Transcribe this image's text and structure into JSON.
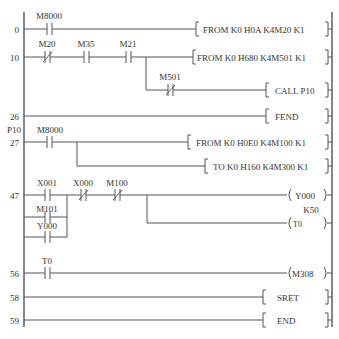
{
  "diagram": {
    "type": "PLC ladder diagram",
    "line_color": "#555555",
    "text_color": "#333333",
    "rungs": [
      {
        "step": "0",
        "contacts": [
          {
            "label": "M8000",
            "type": "NO"
          }
        ],
        "instruction": "[ FROM  K0  H0A  K4M20  K1 ]"
      },
      {
        "step": "10",
        "contacts": [
          {
            "label": "M20",
            "type": "NC"
          },
          {
            "label": "M35",
            "type": "NO"
          },
          {
            "label": "M21",
            "type": "NO"
          }
        ],
        "instruction": "[FROM  K0  H680  K4M501  K1]",
        "branch": {
          "contacts": [
            {
              "label": "M501",
              "type": "NC"
            }
          ],
          "instruction": "[ CALL  P10 ]"
        }
      },
      {
        "step": "26",
        "contacts": [],
        "instruction": "[ FEND        ]"
      },
      {
        "pointer": "P10",
        "step": "27",
        "contacts": [
          {
            "label": "M8000",
            "type": "NO"
          }
        ],
        "instruction": "[ FROM  K0  H0E0  K4M100  K1]",
        "branch": {
          "contacts": [],
          "instruction": "[ TO  K0  H160  K4M300  K1]"
        }
      },
      {
        "step": "47",
        "contacts": [
          {
            "label": "X001",
            "type": "NO"
          },
          {
            "label": "X000",
            "type": "NC"
          },
          {
            "label": "M100",
            "type": "NC"
          }
        ],
        "parallel_contacts": [
          {
            "label": "M101",
            "type": "NO"
          },
          {
            "label": "Y000",
            "type": "NO"
          }
        ],
        "coil": "( Y000 )",
        "branch": {
          "coil": "(T0      )",
          "setting": "K50"
        }
      },
      {
        "step": "56",
        "contacts": [
          {
            "label": "T0",
            "type": "NO"
          }
        ],
        "coil": "(M308 )"
      },
      {
        "step": "58",
        "contacts": [],
        "instruction": "[ SRET       ]"
      },
      {
        "step": "59",
        "contacts": [],
        "instruction": "[ END        ]"
      }
    ]
  },
  "labels": {
    "r0_step": "0",
    "r0_c1": "M8000",
    "r0_instr": "FROM  K0  H0A  K4M20  K1",
    "r1_step": "10",
    "r1_c1": "M20",
    "r1_c2": "M35",
    "r1_c3": "M21",
    "r1_instr": "FROM  K0  H680  K4M501  K1",
    "r1_b_c1": "M501",
    "r1_b_instr": "CALL  P10",
    "r2_step": "26",
    "r2_instr": "FEND",
    "r3_pointer": "P10",
    "r3_step": "27",
    "r3_c1": "M8000",
    "r3_instr": "FROM  K0  H0E0  K4M100  K1",
    "r3_b_instr": "TO  K0  H160  K4M300  K1",
    "r4_step": "47",
    "r4_c1": "X001",
    "r4_c2": "X000",
    "r4_c3": "M100",
    "r4_p1": "M101",
    "r4_p2": "Y000",
    "r4_coil": "Y000",
    "r4_b_set": "K50",
    "r4_b_coil": "T0",
    "r5_step": "56",
    "r5_c1": "T0",
    "r5_coil": "M308",
    "r6_step": "58",
    "r6_instr": "SRET",
    "r7_step": "59",
    "r7_instr": "END"
  }
}
